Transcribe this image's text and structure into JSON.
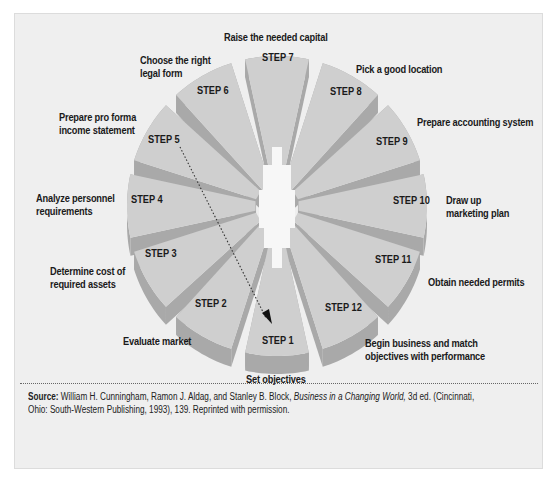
{
  "steps": [
    {
      "id": "step-1",
      "label": "STEP 1",
      "description": "Set objectives"
    },
    {
      "id": "step-2",
      "label": "STEP 2",
      "description": "Evaluate market"
    },
    {
      "id": "step-3",
      "label": "STEP 3",
      "description": "Determine cost of\nrequired assets"
    },
    {
      "id": "step-4",
      "label": "STEP 4",
      "description": "Analyze personnel\nrequirements"
    },
    {
      "id": "step-5",
      "label": "STEP 5",
      "description": "Prepare pro forma\nincome statement"
    },
    {
      "id": "step-6",
      "label": "STEP 6",
      "description": "Choose the right\nlegal form"
    },
    {
      "id": "step-7",
      "label": "STEP 7",
      "description": "Raise the needed capital"
    },
    {
      "id": "step-8",
      "label": "STEP 8",
      "description": "Pick a good location"
    },
    {
      "id": "step-9",
      "label": "STEP 9",
      "description": "Prepare accounting system"
    },
    {
      "id": "step-10",
      "label": "STEP 10",
      "description": "Draw up\nmarketing plan"
    },
    {
      "id": "step-11",
      "label": "STEP 11",
      "description": "Obtain needed permits"
    },
    {
      "id": "step-12",
      "label": "STEP 12",
      "description": "Begin business and match\nobjectives with performance"
    }
  ],
  "source": {
    "prefix": "Source:",
    "authors": " William H. Cunningham, Ramon J. Aldag, and Stanley B. Block, ",
    "title": "Business in a Changing World,",
    "rest": " 3d ed. (Cincinnati,\nOhio: South-Western Publishing, 1993), 139. Reprinted with permission."
  },
  "colors": {
    "panel_bg": "#efefef",
    "segment_top": "#cfcfcf",
    "segment_side": "#a9a9a9",
    "hub": "#f7f7f7",
    "text": "#1a1a1a"
  }
}
